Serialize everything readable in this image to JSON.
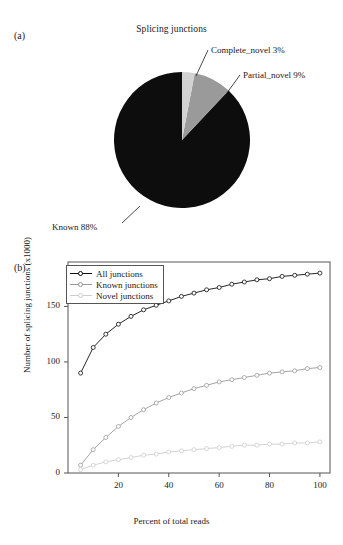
{
  "panels": {
    "a_label": "(a)",
    "b_label": "(b)"
  },
  "colors": {
    "known": "#0d0d0d",
    "partial_novel": "#9a9a9a",
    "complete_novel": "#d2d2d2",
    "axis": "#555555"
  },
  "pie": {
    "title": "Splicing junctions",
    "labels": {
      "complete_novel": "Complete_novel 3%",
      "partial_novel": "Partial_novel 9%",
      "known": "Known 88%"
    }
  },
  "legend": {
    "items": [
      {
        "label": "All junctions",
        "color": "#0d0d0d"
      },
      {
        "label": "Known junctions",
        "color": "#9a9a9a"
      },
      {
        "label": "Novel junctions",
        "color": "#cdcdcd"
      }
    ]
  },
  "axes": {
    "ylabel": "Number of splicing junctions (x1000)",
    "xlabel": "Percent of total reads",
    "yticks": [
      "0",
      "50",
      "100",
      "150"
    ],
    "xticks": [
      "20",
      "40",
      "60",
      "80",
      "100"
    ]
  },
  "chart_data": [
    {
      "type": "pie",
      "title": "Splicing junctions",
      "categories": [
        "Known",
        "Partial_novel",
        "Complete_novel"
      ],
      "values": [
        88,
        9,
        3
      ],
      "units": "percent",
      "colors": [
        "#0d0d0d",
        "#9a9a9a",
        "#d2d2d2"
      ],
      "labels": [
        "Known 88%",
        "Partial_novel 9%",
        "Complete_novel 3%"
      ],
      "start_angle_deg": 0,
      "direction": "clockwise",
      "legend": "none"
    },
    {
      "type": "line",
      "title": "",
      "xlabel": "Percent of total reads",
      "ylabel": "Number of splicing junctions (x1000)",
      "xlim": [
        0,
        104
      ],
      "ylim": [
        0,
        190
      ],
      "xticks": [
        20,
        40,
        60,
        80,
        100
      ],
      "yticks": [
        0,
        50,
        100,
        150
      ],
      "grid": false,
      "legend_position": "top-left",
      "marker": "open-circle",
      "x": [
        5,
        10,
        15,
        20,
        25,
        30,
        35,
        40,
        45,
        50,
        55,
        60,
        65,
        70,
        75,
        80,
        85,
        90,
        95,
        100
      ],
      "series": [
        {
          "name": "All junctions",
          "color": "#0d0d0d",
          "values": [
            90,
            113,
            125,
            134,
            141,
            147,
            151,
            155,
            159,
            162,
            165,
            167,
            170,
            172,
            174,
            175,
            177,
            178,
            179,
            180
          ]
        },
        {
          "name": "Known junctions",
          "color": "#9a9a9a",
          "values": [
            7,
            21,
            32,
            42,
            50,
            57,
            63,
            68,
            72,
            76,
            79,
            82,
            84,
            86,
            88,
            90,
            91,
            92,
            94,
            95
          ]
        },
        {
          "name": "Novel junctions",
          "color": "#cdcdcd",
          "values": [
            3,
            7,
            10,
            12,
            14,
            16,
            17,
            19,
            20,
            21,
            22,
            23,
            24,
            25,
            25,
            26,
            26,
            27,
            27,
            28
          ]
        }
      ]
    }
  ]
}
